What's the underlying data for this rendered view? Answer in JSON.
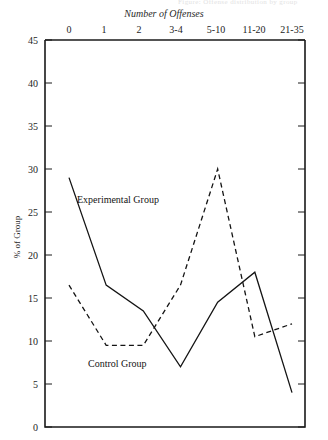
{
  "running_head": "Figure: Offense distribution by group",
  "chart_data": {
    "type": "line",
    "title": "",
    "xlabel": "Number of Offenses",
    "ylabel": "% of Group",
    "categories": [
      "0",
      "1",
      "2",
      "3-4",
      "5-10",
      "11-20",
      "21-35"
    ],
    "ylim": [
      0,
      45
    ],
    "yticks": [
      0,
      5,
      10,
      15,
      20,
      25,
      30,
      35,
      40,
      45
    ],
    "grid": false,
    "legend": "in-plot annotations",
    "xaxis_position": "top",
    "series": [
      {
        "name": "Experimental Group",
        "style": "solid",
        "color": "#141414",
        "values": [
          29,
          16.5,
          13.5,
          7,
          14.5,
          18,
          4
        ]
      },
      {
        "name": "Control Group",
        "style": "dashed",
        "color": "#141414",
        "values": [
          16.5,
          9.5,
          9.5,
          16.5,
          30,
          10.5,
          12
        ]
      }
    ],
    "annotations": [
      {
        "text": "Experimental Group",
        "series": "Experimental Group"
      },
      {
        "text": "Control Group",
        "series": "Control Group"
      }
    ]
  },
  "axes": {
    "top_title": "Number of Offenses",
    "left_title": "% of Group",
    "xticks": [
      "0",
      "1",
      "2",
      "3-4",
      "5-10",
      "11-20",
      "21-35"
    ],
    "yticks": [
      "45",
      "40",
      "35",
      "30",
      "25",
      "20",
      "15",
      "10",
      "5",
      "0"
    ]
  }
}
